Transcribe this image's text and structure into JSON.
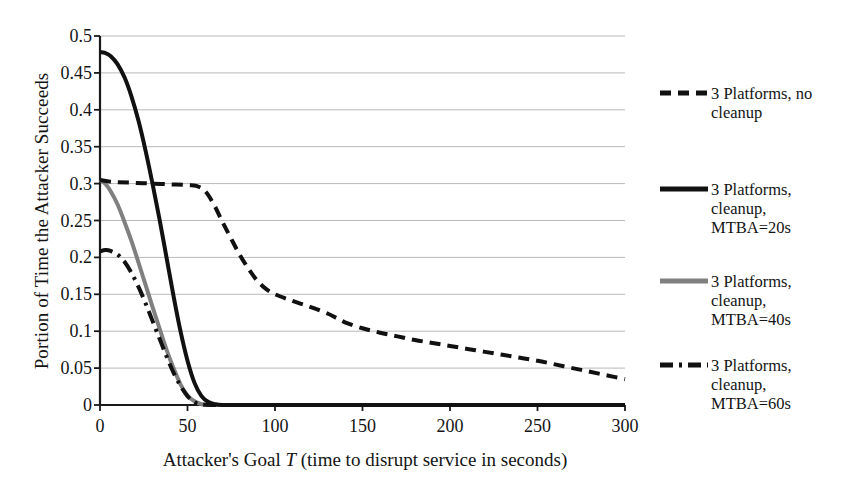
{
  "chart_data": {
    "type": "line",
    "title": "",
    "xlabel_pre": "Attacker's Goal ",
    "xlabel_var": "T",
    "xlabel_post": " (time to disrupt service in seconds)",
    "xlabel": "Attacker's Goal T (time to disrupt service in seconds)",
    "ylabel": "Portion of Time the Attacker Succeeds",
    "xlim": [
      0,
      300
    ],
    "ylim": [
      0,
      0.5
    ],
    "grid": "horizontal",
    "legend_position": "right",
    "xticks": [
      "0",
      "50",
      "100",
      "150",
      "200",
      "250",
      "300"
    ],
    "xtick_values": [
      0,
      50,
      100,
      150,
      200,
      250,
      300
    ],
    "yticks": [
      "0.5",
      "0.45",
      "0.4",
      "0.35",
      "0.3",
      "0.25",
      "0.2",
      "0.15",
      "0.1",
      "0.05",
      "0"
    ],
    "ytick_values": [
      0.5,
      0.45,
      0.4,
      0.35,
      0.3,
      0.25,
      0.2,
      0.15,
      0.1,
      0.05,
      0
    ],
    "series": [
      {
        "name": "3 Platforms, no cleanup",
        "label_lines": [
          "3 Platforms, no",
          "cleanup"
        ],
        "color": "#111111",
        "style": "dashed",
        "dasharray": "11,7",
        "width": 4,
        "x": [
          0,
          5,
          10,
          20,
          30,
          40,
          50,
          55,
          60,
          65,
          70,
          75,
          80,
          85,
          90,
          95,
          100,
          110,
          120,
          130,
          135,
          140,
          150,
          160,
          170,
          180,
          190,
          200,
          210,
          220,
          230,
          240,
          250,
          260,
          270,
          280,
          290,
          300
        ],
        "y": [
          0.305,
          0.303,
          0.302,
          0.301,
          0.3,
          0.299,
          0.298,
          0.297,
          0.29,
          0.272,
          0.248,
          0.225,
          0.203,
          0.184,
          0.168,
          0.157,
          0.15,
          0.141,
          0.133,
          0.124,
          0.118,
          0.112,
          0.104,
          0.098,
          0.093,
          0.088,
          0.084,
          0.08,
          0.076,
          0.072,
          0.068,
          0.064,
          0.06,
          0.055,
          0.05,
          0.045,
          0.04,
          0.035
        ]
      },
      {
        "name": "3 Platforms, cleanup, MTBA=20s",
        "label_lines": [
          "3 Platforms,",
          "cleanup,",
          "MTBA=20s"
        ],
        "color": "#111111",
        "style": "solid",
        "dasharray": "",
        "width": 4,
        "x": [
          0,
          3,
          6,
          10,
          14,
          18,
          22,
          26,
          30,
          34,
          38,
          42,
          46,
          50,
          54,
          58,
          62,
          66,
          70,
          80,
          100,
          150,
          200,
          250,
          300
        ],
        "y": [
          0.478,
          0.477,
          0.473,
          0.462,
          0.444,
          0.418,
          0.385,
          0.345,
          0.3,
          0.252,
          0.2,
          0.148,
          0.1,
          0.06,
          0.03,
          0.012,
          0.004,
          0.001,
          0.0,
          0.0,
          0.0,
          0.0,
          0.0,
          0.0,
          0.0
        ]
      },
      {
        "name": "3 Platforms, cleanup, MTBA=40s",
        "label_lines": [
          "3 Platforms,",
          "cleanup,",
          "MTBA=40s"
        ],
        "color": "#808080",
        "style": "solid",
        "dasharray": "",
        "width": 4,
        "x": [
          0,
          3,
          6,
          10,
          14,
          18,
          22,
          26,
          30,
          34,
          38,
          42,
          46,
          50,
          54,
          58,
          62,
          70,
          100,
          150,
          200,
          250,
          300
        ],
        "y": [
          0.305,
          0.3,
          0.29,
          0.272,
          0.248,
          0.222,
          0.193,
          0.163,
          0.133,
          0.104,
          0.075,
          0.05,
          0.028,
          0.013,
          0.005,
          0.001,
          0.0,
          0.0,
          0.0,
          0.0,
          0.0,
          0.0,
          0.0
        ]
      },
      {
        "name": "3 Platforms, cleanup, MTBA=60s",
        "label_lines": [
          "3 Platforms,",
          "cleanup,",
          "MTBA=60s"
        ],
        "color": "#111111",
        "style": "dash-dot",
        "dasharray": "13,6,3,6",
        "width": 4,
        "x": [
          0,
          3,
          6,
          10,
          14,
          18,
          22,
          26,
          30,
          34,
          38,
          42,
          46,
          50,
          54,
          58,
          70,
          100,
          150,
          200,
          250,
          300
        ],
        "y": [
          0.208,
          0.21,
          0.209,
          0.204,
          0.194,
          0.179,
          0.16,
          0.138,
          0.114,
          0.09,
          0.066,
          0.044,
          0.026,
          0.012,
          0.004,
          0.001,
          0.0,
          0.0,
          0.0,
          0.0,
          0.0,
          0.0
        ]
      }
    ]
  },
  "legend": {
    "entries": [
      {
        "lines": [
          "3 Platforms, no",
          "cleanup"
        ]
      },
      {
        "lines": [
          "3 Platforms,",
          "cleanup,",
          "MTBA=20s"
        ]
      },
      {
        "lines": [
          "3 Platforms,",
          "cleanup,",
          "MTBA=40s"
        ]
      },
      {
        "lines": [
          "3 Platforms,",
          "cleanup,",
          "MTBA=60s"
        ]
      }
    ]
  }
}
